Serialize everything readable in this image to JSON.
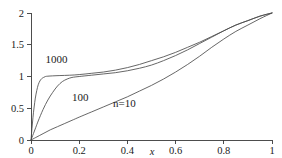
{
  "chart_data": {
    "type": "line",
    "title": "",
    "subtitle": "",
    "xlabel": "x",
    "ylabel": "",
    "xlim": [
      0,
      1
    ],
    "ylim": [
      0,
      2
    ],
    "grid": false,
    "legend_position": "inline-annotations",
    "xticks": [
      0,
      0.2,
      0.4,
      0.6,
      0.8,
      1
    ],
    "xticklabels": [
      "0",
      "0.2",
      "0.4",
      "0.6",
      "0.8",
      "1"
    ],
    "yticks": [
      0,
      0.5,
      1,
      1.5,
      2
    ],
    "yticklabels": [
      "0",
      "0.5",
      "1",
      "1.5",
      "2"
    ],
    "annotations": [
      {
        "text": "1000",
        "x": 0.06,
        "y": 1.22
      },
      {
        "text": "100",
        "x": 0.17,
        "y": 0.62
      },
      {
        "text": "n=10",
        "x": 0.34,
        "y": 0.52
      }
    ],
    "series": [
      {
        "name": "n=10",
        "label": "n=10",
        "color": "#4c4c4c",
        "x": [
          0,
          0.02,
          0.05,
          0.08,
          0.11,
          0.14,
          0.17,
          0.2,
          0.25,
          0.3,
          0.35,
          0.4,
          0.45,
          0.5,
          0.55,
          0.6,
          0.65,
          0.7,
          0.75,
          0.8,
          0.85,
          0.9,
          0.95,
          1
        ],
        "y": [
          0,
          0.04,
          0.1,
          0.16,
          0.21,
          0.26,
          0.31,
          0.36,
          0.44,
          0.52,
          0.6,
          0.68,
          0.77,
          0.86,
          0.96,
          1.07,
          1.19,
          1.32,
          1.46,
          1.59,
          1.71,
          1.81,
          1.91,
          2
        ]
      },
      {
        "name": "n=100",
        "label": "100",
        "color": "#4c4c4c",
        "x": [
          0,
          0.01,
          0.02,
          0.03,
          0.05,
          0.07,
          0.09,
          0.11,
          0.13,
          0.15,
          0.17,
          0.2,
          0.25,
          0.3,
          0.35,
          0.4,
          0.45,
          0.5,
          0.55,
          0.6,
          0.65,
          0.7,
          0.75,
          0.8,
          0.85,
          0.9,
          0.95,
          1
        ],
        "y": [
          0,
          0.1,
          0.2,
          0.3,
          0.48,
          0.63,
          0.75,
          0.85,
          0.92,
          0.96,
          0.985,
          1.0,
          1.02,
          1.04,
          1.06,
          1.09,
          1.13,
          1.18,
          1.25,
          1.33,
          1.42,
          1.52,
          1.62,
          1.72,
          1.81,
          1.88,
          1.95,
          2
        ]
      },
      {
        "name": "n=1000",
        "label": "1000",
        "color": "#4c4c4c",
        "x": [
          0,
          0.004,
          0.008,
          0.013,
          0.018,
          0.024,
          0.03,
          0.037,
          0.044,
          0.052,
          0.06,
          0.07,
          0.09,
          0.12,
          0.16,
          0.2,
          0.25,
          0.3,
          0.35,
          0.4,
          0.45,
          0.5,
          0.55,
          0.6,
          0.65,
          0.7,
          0.75,
          0.8,
          0.85,
          0.9,
          0.95,
          1
        ],
        "y": [
          0,
          0.18,
          0.35,
          0.52,
          0.66,
          0.78,
          0.87,
          0.93,
          0.965,
          0.985,
          1.0,
          1.005,
          1.01,
          1.015,
          1.02,
          1.03,
          1.05,
          1.07,
          1.1,
          1.14,
          1.19,
          1.25,
          1.31,
          1.38,
          1.46,
          1.54,
          1.63,
          1.72,
          1.81,
          1.88,
          1.95,
          2
        ]
      }
    ]
  },
  "axes": {
    "x_axis_name": "x-axis",
    "y_axis_name": "y-axis"
  }
}
